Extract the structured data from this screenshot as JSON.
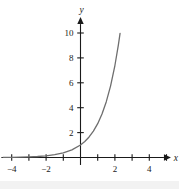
{
  "figure": {
    "name": "exponential-growth-graph",
    "background_color": "#ffffff",
    "curve_color": "#6e6e6e",
    "axis_color": "#1a1a1a",
    "text_color": "#1a1a1a"
  },
  "chart_data": {
    "type": "line",
    "title": "",
    "subtitle": "",
    "xlabel": "x",
    "ylabel": "y",
    "xlim": [
      -4.6,
      5.2
    ],
    "ylim": [
      -0.6,
      11.2
    ],
    "grid": false,
    "legend": null,
    "x_ticks": [
      -4,
      -3,
      -2,
      -1,
      1,
      2,
      3,
      4,
      5
    ],
    "x_tick_labels": [
      "-4",
      "",
      "-2",
      "",
      "",
      "2",
      "",
      "4",
      ""
    ],
    "x_labeled_ticks": [
      {
        "value": -4,
        "label": "−4"
      },
      {
        "value": -2,
        "label": "−2"
      },
      {
        "value": 2,
        "label": "2"
      },
      {
        "value": 4,
        "label": "4"
      }
    ],
    "y_ticks": [
      2,
      4,
      6,
      8,
      10
    ],
    "y_tick_labels": [
      "2",
      "4",
      "6",
      "8",
      "10"
    ],
    "series": [
      {
        "name": "exponential",
        "equation": "y = e^x",
        "color": "#6e6e6e",
        "x": [
          -4.5,
          -4.0,
          -3.5,
          -3.0,
          -2.5,
          -2.0,
          -1.5,
          -1.0,
          -0.5,
          0.0,
          0.25,
          0.5,
          0.75,
          1.0,
          1.25,
          1.5,
          1.75,
          2.0,
          2.2,
          2.3
        ],
        "y": [
          0.011,
          0.018,
          0.03,
          0.05,
          0.082,
          0.135,
          0.223,
          0.368,
          0.607,
          1.0,
          1.284,
          1.649,
          2.117,
          2.718,
          3.49,
          4.482,
          5.755,
          7.389,
          9.025,
          9.974
        ]
      }
    ],
    "annotations": []
  },
  "axis_labels": {
    "x_axis_name": "x",
    "y_axis_name": "y"
  }
}
